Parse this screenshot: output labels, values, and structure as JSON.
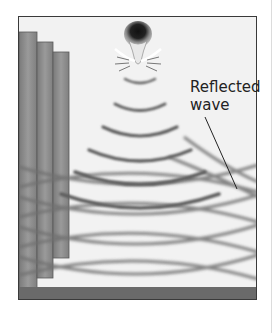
{
  "figure": {
    "label_line1": "Reflected",
    "label_line2": "wave",
    "elements": {
      "source": "bat-icon",
      "wall": "stepped-wall",
      "floor": "ground-strip",
      "emitted_waves": "concentric-arcs",
      "reflected_waves": "crossing-wave-pattern"
    },
    "colors": {
      "background": "#f2f2f2",
      "wave": "#6e6e6e",
      "wall": "#8a8a8a",
      "floor": "#6a6a6a",
      "border": "#3a3a3a"
    }
  }
}
